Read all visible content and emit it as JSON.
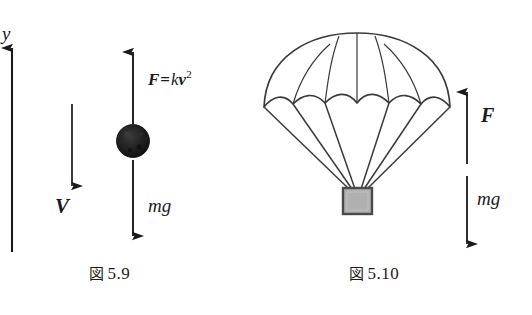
{
  "figure": {
    "background_color": "#ffffff",
    "ink_color": "#1a1a1a",
    "panels": [
      {
        "id": "falling-sphere",
        "caption_prefix": "図",
        "caption_number": "5.9",
        "caption": "図 5.9",
        "labels": {
          "axis_y": "y",
          "velocity": "V",
          "force_symbol": "F",
          "force_equals": "=",
          "force_coefficient": "k",
          "force_variable": "v",
          "force_exponent": "2",
          "force_expression": "F = kv²",
          "weight": "mg"
        },
        "elements": {
          "sphere_color": "#171717",
          "axis_direction": "up",
          "velocity_direction": "down",
          "force_direction": "up",
          "weight_direction": "down"
        }
      },
      {
        "id": "parachute",
        "caption_prefix": "図",
        "caption_number": "5.10",
        "caption": "図 5.10",
        "labels": {
          "force_symbol": "F",
          "weight": "mg"
        },
        "elements": {
          "canopy_fill": "#ffffff",
          "canopy_stroke": "#3a3a3a",
          "payload_fill": "#b0b0b0",
          "payload_stroke": "#4a4a4a",
          "suspension_line_count": 6,
          "gore_count": 5,
          "force_direction": "up",
          "weight_direction": "down"
        }
      }
    ]
  }
}
